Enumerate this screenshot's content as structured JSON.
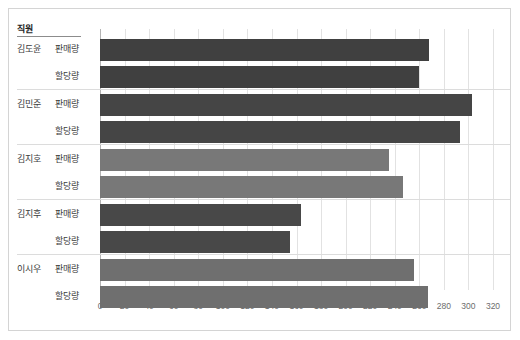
{
  "chart_data": {
    "type": "bar",
    "orientation": "horizontal",
    "title": "",
    "xlabel": "",
    "ylabel": "",
    "xlim": [
      0,
      320
    ],
    "xticks": [
      0,
      20,
      40,
      60,
      80,
      100,
      120,
      140,
      160,
      180,
      200,
      220,
      240,
      260,
      280,
      300,
      320
    ],
    "grid": true,
    "legend": "none",
    "header_label": "직원",
    "series_names": [
      "판매량",
      "할당량"
    ],
    "categories": [
      "김도윤",
      "김민준",
      "김지호",
      "김지후",
      "이시우"
    ],
    "series": [
      {
        "name": "판매량",
        "values": [
          268,
          303,
          235,
          164,
          256
        ]
      },
      {
        "name": "할당량",
        "values": [
          260,
          293,
          247,
          155,
          267
        ]
      }
    ],
    "bar_colors": {
      "김도윤": "#404040",
      "김민준": "#454545",
      "김지호": "#787878",
      "김지후": "#484848",
      "이시우": "#6f6f6f"
    },
    "colors": {
      "frame": "#d4d4d4",
      "gridline": "#e2e2e2",
      "axis": "#b4b4b4",
      "tick_text": "#6d6d6d",
      "label_text": "#3c3c3c",
      "header_text": "#1f1f1f",
      "separator": "#dcdcdc",
      "background": "#ffffff"
    }
  }
}
